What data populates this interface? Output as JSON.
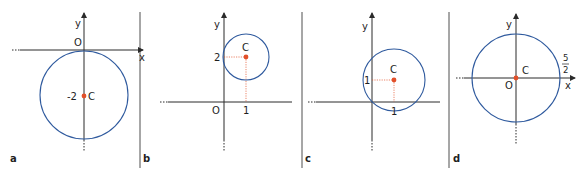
{
  "colors": {
    "axis": "#2a2a2a",
    "circle": "#2f5a9e",
    "center_point": "#e2502a",
    "guide": "#e2502a",
    "divider": "#3a3a3a"
  },
  "panels": [
    {
      "id": "a",
      "label": "a",
      "axis_labels": {
        "x": "x",
        "y": "y",
        "origin": "O"
      },
      "center_label": "C",
      "center_coord_label": "-2",
      "circle": {
        "center": [
          0,
          -2
        ],
        "radius": 2
      }
    },
    {
      "id": "b",
      "label": "b",
      "axis_labels": {
        "x": "x",
        "y": "y",
        "origin": "O"
      },
      "center_label": "C",
      "tick_y": "2",
      "tick_x": "1",
      "circle": {
        "center": [
          1,
          2
        ],
        "radius": 1
      }
    },
    {
      "id": "c",
      "label": "c",
      "axis_labels": {
        "x": "x",
        "y": "y"
      },
      "center_label": "C",
      "tick_y": "1",
      "tick_x": "1",
      "circle": {
        "center": [
          1,
          1
        ],
        "radius": 1.414
      }
    },
    {
      "id": "d",
      "label": "d",
      "axis_labels": {
        "x": "x",
        "y": "y",
        "origin": "O"
      },
      "center_label": "C",
      "radius_label_num": "5",
      "radius_label_den": "2",
      "circle": {
        "center": [
          0,
          0
        ],
        "radius": 2.5
      }
    }
  ]
}
